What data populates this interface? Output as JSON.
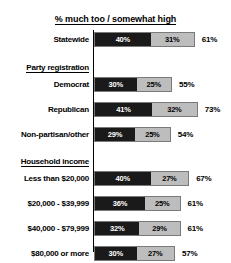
{
  "chart_data": {
    "type": "bar",
    "title": "% much too / somewhat high",
    "xlabel": "",
    "ylabel": "",
    "orientation": "horizontal",
    "stacked": true,
    "grid": false,
    "legend_position": "none",
    "xlim": [
      0,
      80
    ],
    "colors": {
      "much_too_high": "#1a1a1a",
      "somewhat_high": "#bdbdbd",
      "bar_border": "#7a7a7a",
      "axis": "#000000",
      "text": "#000000",
      "background": "#ffffff"
    },
    "series": [
      {
        "name": "much too high",
        "key": "much",
        "color": "#1a1a1a"
      },
      {
        "name": "somewhat high",
        "key": "somewhat",
        "color": "#bdbdbd"
      }
    ],
    "categories": [
      "Statewide",
      "Democrat",
      "Republican",
      "Non-partisan/other",
      "Less than $20,000",
      "$20,000 - $39,999",
      "$40,000 - $79,999",
      "$80,000 or more"
    ],
    "values": {
      "much": [
        40,
        30,
        41,
        29,
        40,
        36,
        32,
        30
      ],
      "somewhat": [
        31,
        25,
        32,
        25,
        27,
        25,
        29,
        27
      ]
    },
    "totals": [
      61,
      55,
      73,
      54,
      67,
      61,
      61,
      57
    ]
  },
  "rows": [
    {
      "type": "bar",
      "label": "Statewide",
      "much": "40%",
      "somewhat": "31%",
      "total": "61%",
      "much_value": 40,
      "somewhat_value": 31
    },
    {
      "type": "header",
      "label": "Party registration"
    },
    {
      "type": "bar",
      "label": "Democrat",
      "much": "30%",
      "somewhat": "25%",
      "total": "55%",
      "much_value": 30,
      "somewhat_value": 25
    },
    {
      "type": "bar",
      "label": "Republican",
      "much": "41%",
      "somewhat": "32%",
      "total": "73%",
      "much_value": 41,
      "somewhat_value": 32
    },
    {
      "type": "bar",
      "label": "Non-partisan/other",
      "much": "29%",
      "somewhat": "25%",
      "total": "54%",
      "much_value": 29,
      "somewhat_value": 25
    },
    {
      "type": "header",
      "label": "Household income"
    },
    {
      "type": "bar",
      "label": "Less than $20,000",
      "much": "40%",
      "somewhat": "27%",
      "total": "67%",
      "much_value": 40,
      "somewhat_value": 27
    },
    {
      "type": "bar",
      "label": "$20,000 - $39,999",
      "much": "36%",
      "somewhat": "25%",
      "total": "61%",
      "much_value": 36,
      "somewhat_value": 25
    },
    {
      "type": "bar",
      "label": "$40,000 - $79,999",
      "much": "32%",
      "somewhat": "29%",
      "total": "61%",
      "much_value": 32,
      "somewhat_value": 29
    },
    {
      "type": "bar",
      "label": "$80,000 or more",
      "much": "30%",
      "somewhat": "27%",
      "total": "57%",
      "much_value": 30,
      "somewhat_value": 27
    }
  ]
}
